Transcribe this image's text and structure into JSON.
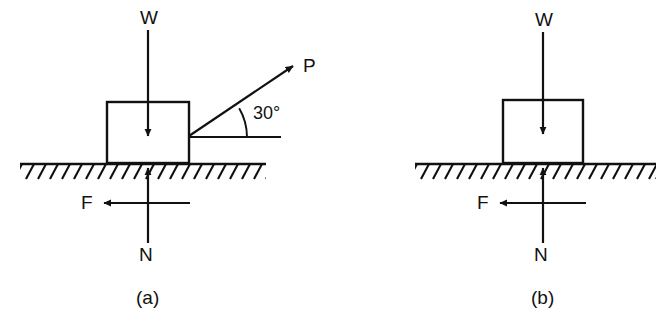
{
  "figure": {
    "background_color": "#ffffff",
    "line_color": "#111111",
    "panels": [
      {
        "id": "panel-a",
        "caption": "(a)",
        "description": "Block on rough ground pulled by force P inclined at 30 degrees above the horizontal",
        "block": {
          "x": 107,
          "y": 102,
          "width": 82,
          "height": 61
        },
        "ground": {
          "x1": 20,
          "x2": 266,
          "y": 164,
          "hatching": true
        },
        "forces": [
          {
            "name": "W",
            "label": "W",
            "direction": "down",
            "role": "weight",
            "tail": {
              "x": 148,
              "y": 30
            },
            "head": {
              "x": 148,
              "y": 138
            },
            "label_pos": {
              "x": 140,
              "y": 8
            }
          },
          {
            "name": "P",
            "label": "P",
            "direction": "up-right",
            "role": "applied-pull",
            "angle_deg": 30,
            "tail": {
              "x": 189,
              "y": 136
            },
            "head": {
              "x": 296,
              "y": 64
            },
            "label_pos": {
              "x": 303,
              "y": 56
            }
          },
          {
            "name": "F",
            "label": "F",
            "direction": "left",
            "role": "friction",
            "tail": {
              "x": 190,
              "y": 203
            },
            "head": {
              "x": 101,
              "y": 203
            },
            "label_pos": {
              "x": 81,
              "y": 193
            }
          },
          {
            "name": "N",
            "label": "N",
            "direction": "up",
            "role": "normal-reaction",
            "tail": {
              "x": 148,
              "y": 243
            },
            "head": {
              "x": 148,
              "y": 166
            },
            "label_pos": {
              "x": 139,
              "y": 245
            }
          }
        ],
        "angle": {
          "value": "30°",
          "vertex": {
            "x": 189,
            "y": 136
          },
          "label_pos": {
            "x": 253,
            "y": 104
          },
          "reference_line": {
            "x1": 189,
            "x2": 281,
            "y": 137
          },
          "arc_radius": 58
        },
        "caption_pos": {
          "x": 136,
          "y": 288
        }
      },
      {
        "id": "panel-b",
        "caption": "(b)",
        "description": "Block resting on rough ground with weight, friction and normal reaction only",
        "block": {
          "x": 503,
          "y": 100,
          "width": 80,
          "height": 63
        },
        "ground": {
          "x1": 415,
          "x2": 656,
          "y": 164,
          "hatching": true
        },
        "forces": [
          {
            "name": "W",
            "label": "W",
            "direction": "down",
            "role": "weight",
            "tail": {
              "x": 543,
              "y": 32
            },
            "head": {
              "x": 543,
              "y": 136
            },
            "label_pos": {
              "x": 535,
              "y": 10
            }
          },
          {
            "name": "F",
            "label": "F",
            "direction": "left",
            "role": "friction",
            "tail": {
              "x": 586,
              "y": 203
            },
            "head": {
              "x": 497,
              "y": 203
            },
            "label_pos": {
              "x": 477,
              "y": 193
            }
          },
          {
            "name": "N",
            "label": "N",
            "direction": "up",
            "role": "normal-reaction",
            "tail": {
              "x": 543,
              "y": 243
            },
            "head": {
              "x": 543,
              "y": 166
            },
            "label_pos": {
              "x": 534,
              "y": 245
            }
          }
        ],
        "caption_pos": {
          "x": 531,
          "y": 288
        }
      }
    ]
  }
}
